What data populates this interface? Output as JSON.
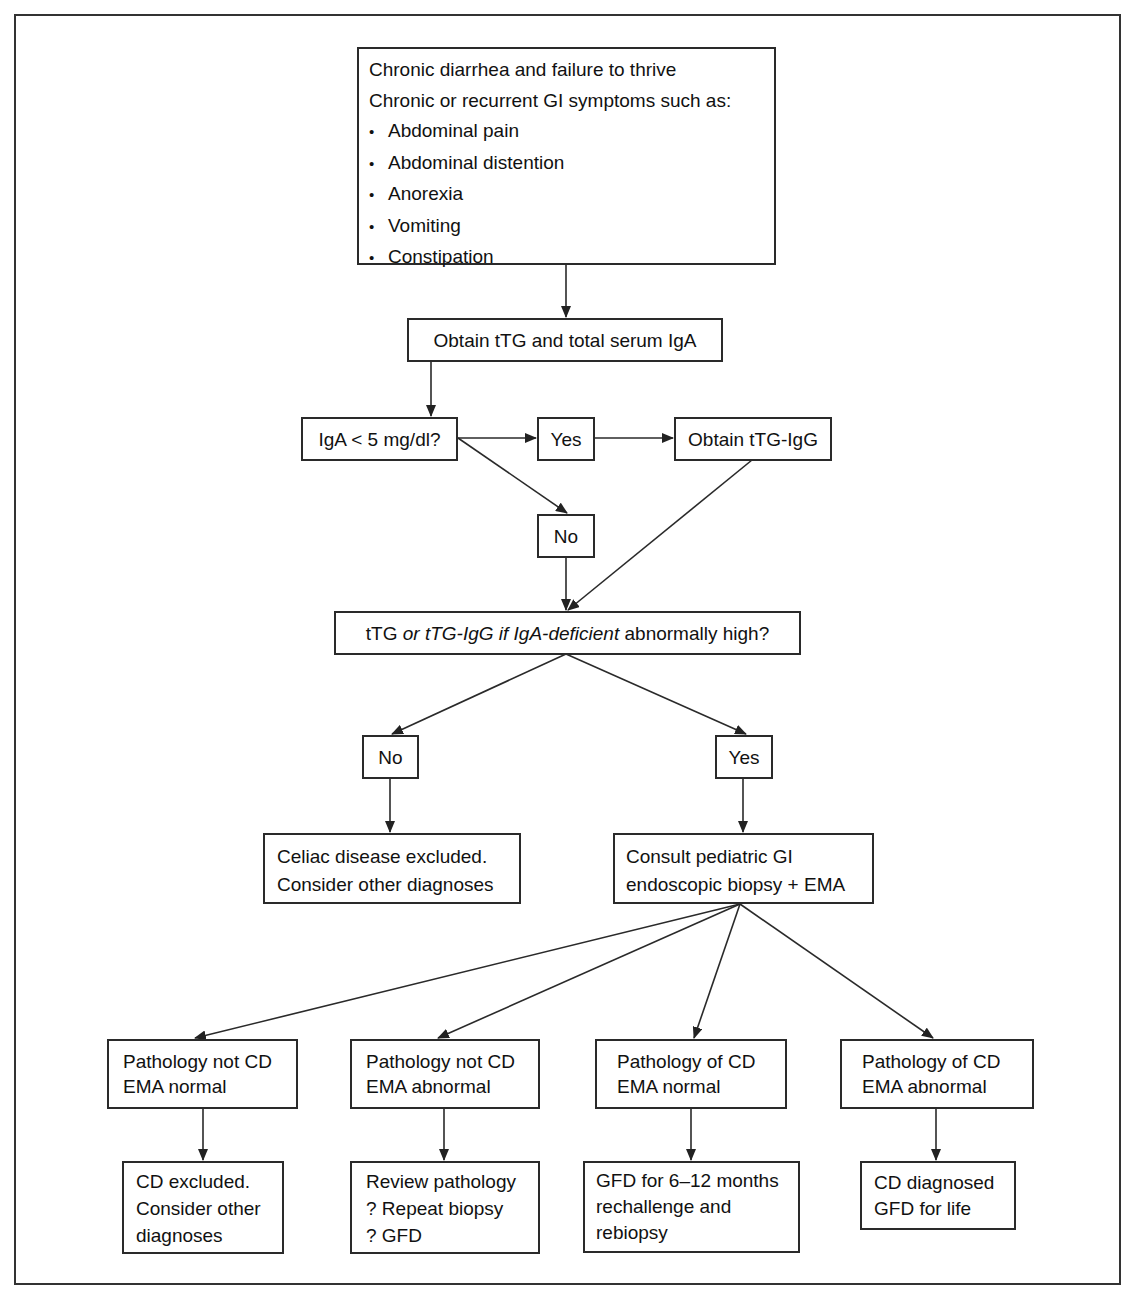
{
  "flowchart": {
    "symptoms": {
      "line1": "Chronic diarrhea and failure to thrive",
      "line2": "Chronic or recurrent GI symptoms such as:",
      "bullets": [
        "Abdominal pain",
        "Abdominal distention",
        "Anorexia",
        "Vomiting",
        "Constipation"
      ]
    },
    "obtain_ttg": "Obtain tTG and total serum IgA",
    "iga_question": "IgA < 5 mg/dl?",
    "iga_yes": "Yes",
    "obtain_ttg_igg": "Obtain tTG-IgG",
    "iga_no": "No",
    "ttg_question": {
      "part1": "tTG ",
      "part2_italic": "or tTG-IgG if IgA-deficient",
      "part3": " abnormally high?"
    },
    "ttg_no": "No",
    "ttg_yes": "Yes",
    "celiac_excluded": {
      "line1": "Celiac disease excluded.",
      "line2": "Consider other diagnoses"
    },
    "consult": {
      "line1": "Consult pediatric GI",
      "line2": "endoscopic biopsy + EMA"
    },
    "outcomes": [
      {
        "condition": {
          "line1": "Pathology not CD",
          "line2": "EMA normal"
        },
        "action": [
          "CD excluded.",
          "Consider other",
          "diagnoses"
        ]
      },
      {
        "condition": {
          "line1": "Pathology not CD",
          "line2": "EMA abnormal"
        },
        "action": [
          "Review pathology",
          "? Repeat biopsy",
          "? GFD"
        ]
      },
      {
        "condition": {
          "line1": "Pathology of CD",
          "line2": "EMA normal"
        },
        "action": [
          "GFD for 6–12 months",
          "rechallenge and",
          "rebiopsy"
        ]
      },
      {
        "condition": {
          "line1": "Pathology of CD",
          "line2": "EMA abnormal"
        },
        "action": [
          "CD diagnosed",
          "GFD for life"
        ]
      }
    ],
    "colors": {
      "line": "#2a2a2a",
      "background": "#ffffff",
      "text": "#111111"
    }
  }
}
